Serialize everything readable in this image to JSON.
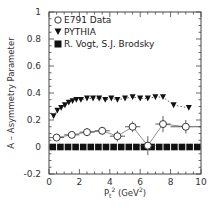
{
  "chart_data": {
    "type": "scatter",
    "title": "",
    "xlabel": "P_t^2 (GeV^2)",
    "ylabel": "A – Asymmetry Parameter",
    "xlim": [
      0,
      10
    ],
    "ylim": [
      -0.2,
      1.0
    ],
    "x_ticks": [
      "0",
      "2",
      "4",
      "6",
      "8",
      "10"
    ],
    "y_ticks": [
      "-0.2",
      "0",
      "0.2",
      "0.4",
      "0.6",
      "0.8",
      "1"
    ],
    "grid": false,
    "legend_position": "upper-left",
    "series": [
      {
        "name": "E791 Data",
        "marker": "open-circle",
        "x": [
          0.5,
          1.5,
          2.5,
          3.5,
          4.5,
          5.5,
          6.5,
          7.5,
          9.0
        ],
        "y": [
          0.07,
          0.09,
          0.11,
          0.12,
          0.08,
          0.15,
          0.01,
          0.17,
          0.15
        ],
        "xerr": [
          0.5,
          0.5,
          0.5,
          0.5,
          0.5,
          0.5,
          0.5,
          0.5,
          1.0
        ],
        "yerr": [
          0.02,
          0.02,
          0.03,
          0.03,
          0.04,
          0.04,
          0.07,
          0.06,
          0.05
        ]
      },
      {
        "name": "PYTHIA",
        "marker": "filled-down-triangle",
        "x": [
          0.3,
          0.55,
          0.8,
          1.05,
          1.3,
          1.55,
          1.8,
          2.1,
          2.5,
          2.9,
          3.3,
          3.7,
          4.1,
          4.5,
          5.0,
          5.5,
          6.0,
          6.5,
          7.0,
          7.5,
          8.2,
          9.2
        ],
        "y": [
          0.23,
          0.27,
          0.29,
          0.31,
          0.33,
          0.34,
          0.35,
          0.35,
          0.36,
          0.36,
          0.36,
          0.35,
          0.36,
          0.35,
          0.36,
          0.37,
          0.36,
          0.36,
          0.37,
          0.37,
          0.31,
          0.29
        ]
      },
      {
        "name": "R. Vogt, S.J. Brodsky",
        "marker": "filled-square",
        "x": [
          0.25,
          0.75,
          1.25,
          1.75,
          2.25,
          2.75,
          3.25,
          3.75,
          4.25,
          4.75,
          5.25,
          5.75,
          6.25,
          6.75,
          7.25,
          7.75,
          8.25,
          8.75,
          9.25,
          9.75
        ],
        "y": [
          0,
          0,
          0,
          0,
          0,
          0,
          0,
          0,
          0,
          0,
          0,
          0,
          0,
          0,
          0,
          0,
          0,
          0,
          0,
          0
        ]
      }
    ]
  },
  "labels": {
    "ylabel": "A – Asymmetry Parameter",
    "xlabel_main": "P",
    "xlabel_sub": "t",
    "xlabel_sup": "2",
    "xlabel_unit": " (GeV",
    "xlabel_unit_sup": "2",
    "xlabel_close": ")",
    "legend": [
      "E791 Data",
      "PYTHIA",
      "R. Vogt, S.J. Brodsky"
    ]
  },
  "colors": {
    "frame": "#444444",
    "marker": "#111111",
    "text": "#333333"
  }
}
